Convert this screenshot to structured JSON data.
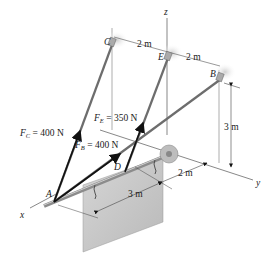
{
  "diagram": {
    "type": "3D statics free-body diagram",
    "axes": {
      "x_label": "x",
      "y_label": "y",
      "z_label": "z"
    },
    "points": {
      "A": "A",
      "B": "B",
      "C": "C",
      "D": "D",
      "E": "E"
    },
    "forces": [
      {
        "symbol": "F",
        "sub": "C",
        "value_text": " = 400 N"
      },
      {
        "symbol": "F",
        "sub": "E",
        "value_text": " = 350 N"
      },
      {
        "symbol": "F",
        "sub": "B",
        "value_text": " = 400 N"
      }
    ],
    "dimensions": {
      "c_to_e": "2 m",
      "e_to_b": "2 m",
      "b_height": "3 m",
      "y_offset": "2 m",
      "sign_length": "3 m"
    },
    "colors": {
      "rod": "#8a8a8a",
      "cable": "#707070",
      "arrow": "#111111",
      "plate": "#c8c8c8",
      "dim_line": "#444444"
    }
  }
}
